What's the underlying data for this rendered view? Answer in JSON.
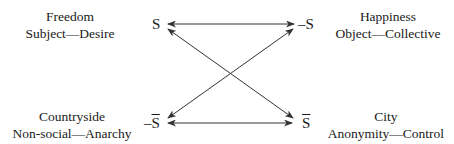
{
  "diagram": {
    "nodes": {
      "top_left": {
        "title": "Freedom",
        "subtitle": "Subject—Desire",
        "symbol": "S"
      },
      "top_right": {
        "title": "Happiness",
        "subtitle": "Object—Collective",
        "symbol_prefix": "–",
        "symbol": "S"
      },
      "bottom_left": {
        "title": "Countryside",
        "subtitle": "Non-social—Anarchy",
        "symbol_prefix": "–",
        "symbol": "S"
      },
      "bottom_right": {
        "title": "City",
        "subtitle": "Anonymity—Control",
        "symbol": "S"
      }
    },
    "edges": [
      {
        "from": "top_left",
        "to": "top_right",
        "type": "double-arrow"
      },
      {
        "from": "bottom_left",
        "to": "bottom_right",
        "type": "double-arrow"
      },
      {
        "from": "top_left",
        "to": "bottom_right",
        "type": "double-arrow"
      },
      {
        "from": "bottom_left",
        "to": "top_right",
        "type": "double-arrow"
      }
    ],
    "colors": {
      "line": "#333333",
      "text": "#1a1a1a",
      "background": "#ffffff"
    }
  }
}
